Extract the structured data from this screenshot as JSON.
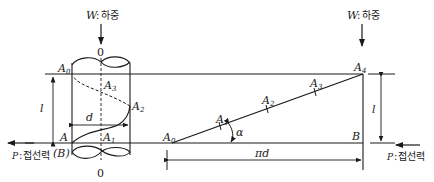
{
  "diagram": {
    "type": "screw-thread-development",
    "colors": {
      "line": "#1a1a1a",
      "background": "#ffffff"
    },
    "load_left": {
      "symbol": "W",
      "label": "하중",
      "separator": ":"
    },
    "load_right": {
      "symbol": "W",
      "label": "하중",
      "separator": ":"
    },
    "force_left": {
      "symbol": "P",
      "label": "접선력",
      "separator": ":"
    },
    "force_right": {
      "symbol": "P",
      "label": "접선력",
      "separator": ":"
    },
    "axis_top_label": "0",
    "axis_bottom_label": "0",
    "cylinder": {
      "top_point": {
        "base": "A",
        "sub": "0"
      },
      "bottom_point": {
        "base": "A",
        "sub": ""
      },
      "bottom_point_alt": "(B)",
      "helix_points": [
        {
          "base": "A",
          "sub": "1"
        },
        {
          "base": "A",
          "sub": "2"
        },
        {
          "base": "A",
          "sub": "3"
        }
      ],
      "diameter_label": "d",
      "length_label": "l"
    },
    "development": {
      "start_point": {
        "base": "A",
        "sub": "0"
      },
      "points": [
        {
          "base": "A",
          "sub": "1"
        },
        {
          "base": "A",
          "sub": "2"
        },
        {
          "base": "A",
          "sub": "3"
        },
        {
          "base": "A",
          "sub": "4"
        }
      ],
      "corner_label": "B",
      "angle_label": "α",
      "circumference_label": "πd",
      "height_label": "l"
    }
  }
}
